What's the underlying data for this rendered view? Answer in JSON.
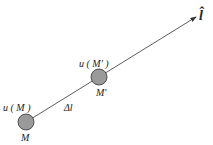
{
  "diagram": {
    "direction_label": "l̂",
    "segment_label": "Δl",
    "points": [
      {
        "name": "M",
        "value_label": "u ( M )"
      },
      {
        "name": "M'",
        "value_label": "u ( M' )"
      }
    ],
    "colors": {
      "line": "#333333",
      "point_fill": "#9a9a9a",
      "point_stroke": "#333333"
    }
  }
}
